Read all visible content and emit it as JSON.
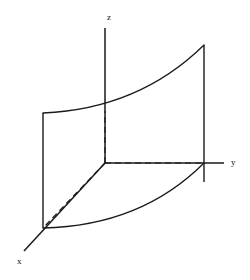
{
  "figure": {
    "background_color": "#ffffff",
    "line_color": "#1a1a1a",
    "width": 250,
    "height": 280,
    "origin": {
      "x": 105,
      "y": 163
    },
    "axes": [
      {
        "id": "z",
        "label": "z",
        "label_x": 107,
        "label_y": 18,
        "from": {
          "x": 105,
          "y": 163
        },
        "to": {
          "x": 105,
          "y": 28
        },
        "orientation": "vertical-up"
      },
      {
        "id": "y",
        "label": "y",
        "label_x": 231,
        "label_y": 163,
        "from": {
          "x": 105,
          "y": 163
        },
        "to": {
          "x": 224,
          "y": 163
        },
        "orientation": "horizontal-right"
      },
      {
        "id": "x",
        "label": "x",
        "label_x": 17,
        "label_y": 262,
        "from": {
          "x": 105,
          "y": 163
        },
        "to": {
          "x": 24,
          "y": 251
        },
        "orientation": "diagonal-down-left"
      }
    ],
    "solid_edges": [
      {
        "id": "left-vertical-edge",
        "path": "M 43 113 L 43 228"
      },
      {
        "id": "right-vertical-edge",
        "path": "M 204 45 L 204 182"
      }
    ],
    "curves": [
      {
        "id": "top-surface-curve",
        "description": "upper boundary curve of the surface, concave up",
        "path": "M 43 113 C 90 111, 150 98, 204 45"
      },
      {
        "id": "bottom-surface-curve",
        "description": "lower boundary curve of the surface, concave up",
        "path": "M 43 228 C 90 227, 152 215, 204 163"
      }
    ],
    "hidden_edges": [
      {
        "id": "vertical-dashed-to-curve",
        "path": "M 105 163 L 105 111"
      },
      {
        "id": "horizontal-dashed-to-y-axis",
        "path": "M 105 163 L 203 163"
      },
      {
        "id": "diagonal-dashed-to-x-corner",
        "path": "M 105 163 L 43 228"
      }
    ]
  }
}
